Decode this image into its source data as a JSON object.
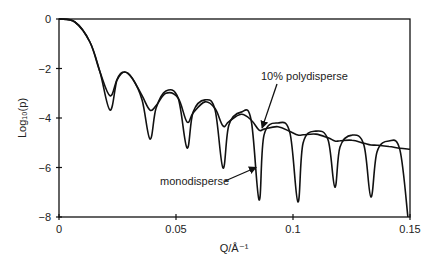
{
  "chart_data": {
    "type": "line",
    "title": "",
    "xlabel": "Q/Å⁻¹",
    "ylabel": "Log₁₀(p)",
    "xlim": [
      0,
      0.15
    ],
    "ylim": [
      -8,
      0
    ],
    "xticks": [
      0,
      0.05,
      0.1,
      0.15
    ],
    "xtick_labels": [
      "0",
      "0.05",
      "0.1",
      "0.15"
    ],
    "yticks": [
      0,
      -2,
      -4,
      -6,
      -8
    ],
    "ytick_labels": [
      "0",
      "−2",
      "−4",
      "−6",
      "−8"
    ],
    "grid": false,
    "annotations": [
      {
        "text": "10% polydisperse",
        "x": 0.0865,
        "y": -2.3,
        "arrow_to": [
          0.0868,
          -4.4
        ]
      },
      {
        "text": "monodisperse",
        "x": 0.0435,
        "y": -6.5,
        "arrow_to": [
          0.0842,
          -6.0
        ]
      }
    ],
    "series": [
      {
        "name": "monodisperse",
        "x": [
          0,
          0.0068,
          0.0132,
          0.0175,
          0.0218,
          0.0248,
          0.0278,
          0.0312,
          0.0355,
          0.0389,
          0.0415,
          0.0457,
          0.0509,
          0.0547,
          0.0573,
          0.0624,
          0.0667,
          0.0701,
          0.0726,
          0.0778,
          0.0821,
          0.0855,
          0.0876,
          0.0936,
          0.0987,
          0.1021,
          0.1043,
          0.1098,
          0.115,
          0.1179,
          0.1201,
          0.1252,
          0.1303,
          0.1333,
          0.1359,
          0.141,
          0.1457,
          0.1491
        ],
        "values": [
          0,
          -0.12,
          -0.93,
          -2.14,
          -3.68,
          -2.46,
          -2.14,
          -2.38,
          -3.27,
          -4.85,
          -3.6,
          -2.91,
          -3.19,
          -5.21,
          -3.76,
          -3.27,
          -3.68,
          -6.02,
          -4.28,
          -3.76,
          -4.08,
          -7.31,
          -4.69,
          -4.2,
          -4.61,
          -7.39,
          -5.01,
          -4.53,
          -4.89,
          -6.79,
          -5.17,
          -4.69,
          -5.09,
          -7.19,
          -5.37,
          -4.93,
          -5.29,
          -8.0
        ]
      },
      {
        "name": "10% polydisperse",
        "x": [
          0,
          0.0068,
          0.0132,
          0.0175,
          0.0218,
          0.0248,
          0.0278,
          0.0312,
          0.0355,
          0.0389,
          0.0415,
          0.0457,
          0.0509,
          0.0547,
          0.0573,
          0.0624,
          0.0667,
          0.0701,
          0.0726,
          0.0778,
          0.0821,
          0.0855,
          0.0876,
          0.0936,
          0.0987,
          0.1021,
          0.1043,
          0.1098,
          0.115,
          0.1179,
          0.1201,
          0.1252,
          0.1303,
          0.1333,
          0.1359,
          0.141,
          0.1457,
          0.15
        ],
        "values": [
          0,
          -0.12,
          -0.93,
          -2.14,
          -3.1,
          -2.46,
          -2.14,
          -2.38,
          -3.1,
          -3.68,
          -3.5,
          -3.0,
          -3.19,
          -4.16,
          -3.8,
          -3.35,
          -3.62,
          -4.32,
          -4.15,
          -3.85,
          -4.08,
          -4.49,
          -4.45,
          -4.35,
          -4.55,
          -4.69,
          -4.68,
          -4.65,
          -4.8,
          -4.93,
          -4.92,
          -4.9,
          -5.02,
          -5.09,
          -5.1,
          -5.15,
          -5.22,
          -5.26
        ]
      }
    ]
  }
}
